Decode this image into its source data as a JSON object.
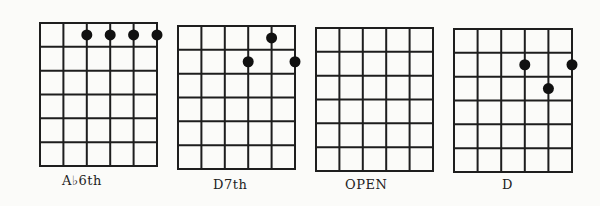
{
  "diagrams": [
    {
      "name": "Ab6th",
      "label": "A♭6th",
      "x": 34,
      "y": 21,
      "w": 117,
      "h": 143,
      "label_x": 62,
      "label_y": 173,
      "dots": [
        {
          "string": 3,
          "fret": 1
        },
        {
          "string": 4,
          "fret": 1
        },
        {
          "string": 5,
          "fret": 1
        },
        {
          "string": 6,
          "fret": 1
        }
      ]
    },
    {
      "name": "D7th",
      "label": "D7th",
      "x": 172,
      "y": 24,
      "w": 117,
      "h": 143,
      "label_x": 213,
      "label_y": 177,
      "dots": [
        {
          "string": 5,
          "fret": 1
        },
        {
          "string": 4,
          "fret": 2
        },
        {
          "string": 6,
          "fret": 2
        }
      ]
    },
    {
      "name": "OPEN",
      "label": "OPEN",
      "x": 310,
      "y": 26,
      "w": 117,
      "h": 143,
      "label_x": 345,
      "label_y": 177,
      "dots": []
    },
    {
      "name": "D",
      "label": "D",
      "x": 448,
      "y": 27,
      "w": 118,
      "h": 143,
      "label_x": 502,
      "label_y": 177,
      "dots": [
        {
          "string": 4,
          "fret": 2
        },
        {
          "string": 6,
          "fret": 2
        },
        {
          "string": 5,
          "fret": 3
        }
      ]
    }
  ],
  "grid": {
    "strings": 6,
    "frets": 6
  },
  "colors": {
    "line": "#1e1e1e",
    "dot": "#111111",
    "background": "#fbfbf9"
  }
}
